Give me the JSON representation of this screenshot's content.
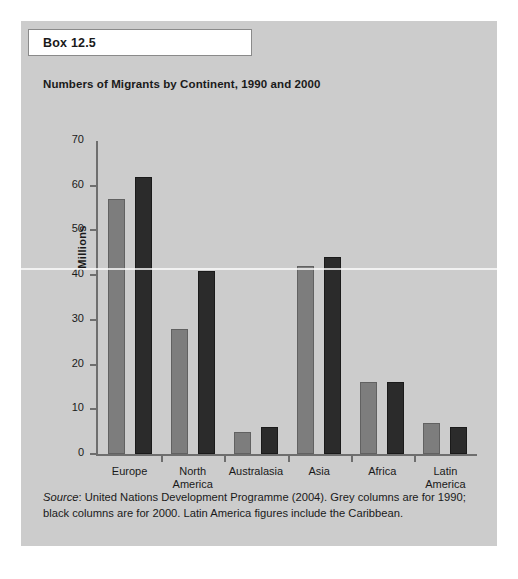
{
  "box": {
    "label": "Box 12.5"
  },
  "chart_data": {
    "type": "bar",
    "title": "Numbers of Migrants by Continent, 1990 and 2000",
    "xlabel": "",
    "ylabel": "Millions",
    "ylim": [
      0,
      70
    ],
    "yticks": [
      0,
      10,
      20,
      30,
      40,
      50,
      60,
      70
    ],
    "grid": false,
    "legend_position": "none",
    "categories": [
      "Europe",
      "North America",
      "Australasia",
      "Asia",
      "Africa",
      "Latin America"
    ],
    "category_lines": [
      [
        "Europe"
      ],
      [
        "North",
        "America"
      ],
      [
        "Australasia"
      ],
      [
        "Asia"
      ],
      [
        "Africa"
      ],
      [
        "Latin",
        "America"
      ]
    ],
    "series": [
      {
        "name": "1990",
        "color": "#7d7d7d",
        "values": [
          57,
          28,
          5,
          42,
          16,
          7
        ]
      },
      {
        "name": "2000",
        "color": "#2b2b2b",
        "values": [
          62,
          41,
          6,
          44,
          16,
          6
        ]
      }
    ]
  },
  "source": {
    "prefix": "Source",
    "text": ": United Nations Development Programme (2004). Grey columns are for 1990; black columns are for 2000. Latin America figures include the Caribbean."
  }
}
